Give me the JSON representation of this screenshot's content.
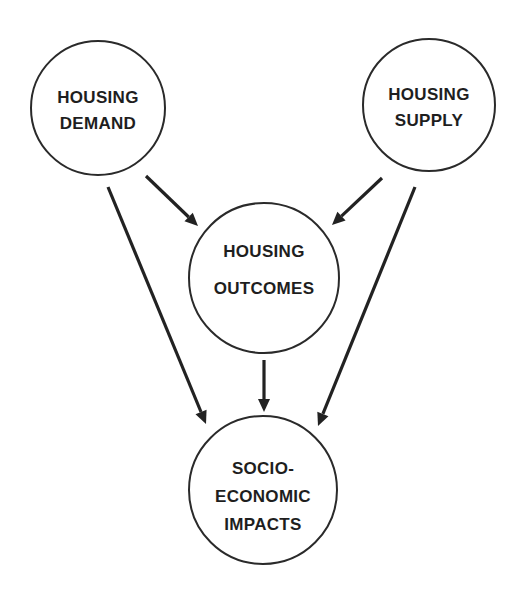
{
  "diagram": {
    "background": "#ffffff",
    "stroke_color": "#2a2a2a",
    "nodes": {
      "demand": {
        "id": "housing-demand",
        "lines": [
          "HOUSING",
          "DEMAND"
        ],
        "cx": 98,
        "cy": 108,
        "r": 67
      },
      "supply": {
        "id": "housing-supply",
        "lines": [
          "HOUSING",
          "SUPPLY"
        ],
        "cx": 429,
        "cy": 105,
        "r": 66
      },
      "outcomes": {
        "id": "housing-outcomes",
        "lines": [
          "HOUSING",
          "OUTCOMES"
        ],
        "cx": 264,
        "cy": 278,
        "r": 75
      },
      "impacts": {
        "id": "socio-economic-impacts",
        "lines": [
          "SOCIO-",
          "ECONOMIC",
          "IMPACTS"
        ],
        "cx": 263,
        "cy": 490,
        "r": 74
      }
    },
    "edges": [
      {
        "from": "housing-demand",
        "to": "housing-outcomes",
        "x1": 146,
        "y1": 176,
        "x2": 198,
        "y2": 226
      },
      {
        "from": "housing-supply",
        "to": "housing-outcomes",
        "x1": 382,
        "y1": 178,
        "x2": 332,
        "y2": 225
      },
      {
        "from": "housing-demand",
        "to": "socio-economic-impacts",
        "x1": 108,
        "y1": 187,
        "x2": 206,
        "y2": 424
      },
      {
        "from": "housing-supply",
        "to": "socio-economic-impacts",
        "x1": 415,
        "y1": 187,
        "x2": 318,
        "y2": 426
      },
      {
        "from": "housing-outcomes",
        "to": "socio-economic-impacts",
        "x1": 264,
        "y1": 360,
        "x2": 264,
        "y2": 412
      }
    ]
  }
}
